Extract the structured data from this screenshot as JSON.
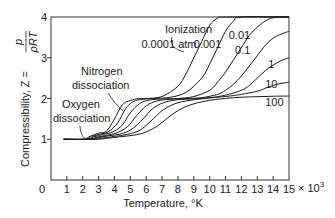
{
  "chart_data": {
    "type": "line",
    "title": "",
    "xlabel": "Temperature, °K",
    "x_multiplier_label": "× 10",
    "x_multiplier_exp": "3",
    "ylabel_prefix": "Compressibility, Z =",
    "ylabel_num": "p",
    "ylabel_den": "ρRT",
    "xlim": [
      0,
      15
    ],
    "ylim": [
      0,
      4
    ],
    "x_ticks": [
      "0",
      "1",
      "2",
      "3",
      "4",
      "5",
      "6",
      "7",
      "8",
      "9",
      "10",
      "11",
      "12",
      "13",
      "14",
      "15"
    ],
    "y_ticks": [
      "0",
      "1",
      "2",
      "3",
      "4"
    ],
    "grid": false,
    "legend": "inline curve labels",
    "series": [
      {
        "name": "0.0001 atm",
        "label": "0.0001 atm",
        "x": [
          0.8,
          2.0,
          2.5,
          3.0,
          3.5,
          4.0,
          4.5,
          5.0,
          5.5,
          6.0,
          7.0,
          8.0,
          8.5,
          9.0,
          9.5,
          10.0,
          10.5,
          11,
          15
        ],
        "y": [
          1,
          1,
          1.08,
          1.15,
          1.2,
          1.5,
          1.85,
          1.95,
          2.0,
          2.0,
          2.05,
          2.3,
          2.6,
          3.0,
          3.4,
          3.8,
          3.97,
          4,
          4
        ]
      },
      {
        "name": "0.001",
        "label": "0.001",
        "x": [
          0.8,
          2.1,
          2.6,
          3.1,
          3.6,
          4.2,
          4.7,
          5.2,
          5.8,
          6.5,
          7.5,
          8.5,
          9.5,
          10.0,
          10.5,
          11.0,
          11.5,
          12,
          15
        ],
        "y": [
          1,
          1,
          1.07,
          1.13,
          1.18,
          1.4,
          1.75,
          1.93,
          1.98,
          2.0,
          2.03,
          2.15,
          2.5,
          2.85,
          3.25,
          3.65,
          3.9,
          4,
          4
        ]
      },
      {
        "name": "0.01",
        "label": "0.01",
        "x": [
          0.8,
          2.2,
          2.7,
          3.3,
          3.9,
          4.5,
          5.0,
          5.6,
          6.2,
          7.0,
          8.0,
          9.0,
          10.0,
          10.5,
          11.0,
          11.5,
          12.0,
          12.5,
          13,
          13.5,
          14,
          15
        ],
        "y": [
          1,
          1,
          1.06,
          1.12,
          1.18,
          1.35,
          1.65,
          1.88,
          1.96,
          1.99,
          2.0,
          2.05,
          2.2,
          2.4,
          2.65,
          2.95,
          3.25,
          3.55,
          3.75,
          3.9,
          3.98,
          4
        ]
      },
      {
        "name": "0.1",
        "label": "0.1",
        "x": [
          0.8,
          2.3,
          2.9,
          3.5,
          4.1,
          4.8,
          5.4,
          6.0,
          6.7,
          7.5,
          8.5,
          9.5,
          10.5,
          11.0,
          11.5,
          12.0,
          12.5,
          13.0,
          13.5,
          14.0,
          14.5,
          15
        ],
        "y": [
          1,
          1,
          1.05,
          1.1,
          1.15,
          1.3,
          1.58,
          1.82,
          1.94,
          1.98,
          2.0,
          2.02,
          2.1,
          2.2,
          2.35,
          2.55,
          2.8,
          3.05,
          3.3,
          3.48,
          3.58,
          3.65
        ]
      },
      {
        "name": "1",
        "label": "1",
        "x": [
          0.8,
          2.4,
          3.0,
          3.7,
          4.4,
          5.1,
          5.8,
          6.4,
          7.1,
          8.0,
          9.0,
          10.0,
          11.0,
          12.0,
          12.5,
          13.0,
          13.5,
          14.0,
          14.5,
          15
        ],
        "y": [
          1,
          1,
          1.04,
          1.09,
          1.13,
          1.25,
          1.5,
          1.75,
          1.9,
          1.97,
          1.99,
          2.02,
          2.08,
          2.2,
          2.32,
          2.5,
          2.68,
          2.82,
          2.93,
          3.0
        ]
      },
      {
        "name": "10",
        "label": "10",
        "x": [
          0.8,
          2.6,
          3.2,
          4.0,
          4.8,
          5.6,
          6.3,
          7.0,
          7.8,
          8.7,
          9.7,
          11.0,
          12.0,
          13.0,
          13.5,
          14.0,
          14.5,
          15
        ],
        "y": [
          1,
          1,
          1.03,
          1.07,
          1.12,
          1.22,
          1.45,
          1.7,
          1.87,
          1.95,
          2.0,
          2.05,
          2.1,
          2.18,
          2.25,
          2.32,
          2.37,
          2.4
        ]
      },
      {
        "name": "100",
        "label": "100",
        "x": [
          0.8,
          2.8,
          3.5,
          4.3,
          5.2,
          6.0,
          6.8,
          7.6,
          8.5,
          9.5,
          10.5,
          11.5,
          12.5,
          13.5,
          14.5,
          15
        ],
        "y": [
          1,
          1,
          1.02,
          1.06,
          1.1,
          1.18,
          1.35,
          1.6,
          1.8,
          1.92,
          1.98,
          2.02,
          2.04,
          2.05,
          2.06,
          2.06
        ]
      }
    ],
    "annotations": [
      {
        "text": "Ionization",
        "points_to": {
          "x": 8.5,
          "y": 2.7
        }
      },
      {
        "text": "Nitrogen dissociation",
        "lines": [
          "Nitrogen",
          "dissociation"
        ],
        "points_to": {
          "x": 4.6,
          "y": 1.8
        }
      },
      {
        "text": "Oxygen dissociation",
        "lines": [
          "Oxygen",
          "dissociation"
        ],
        "points_to": {
          "x": 2.2,
          "y": 1.02
        }
      }
    ]
  }
}
